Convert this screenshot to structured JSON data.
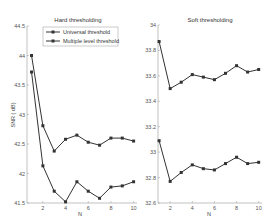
{
  "chart_data": [
    {
      "type": "line",
      "title": "Hard thresholding",
      "xlabel": "N",
      "ylabel": "SNR ( dB)",
      "x": [
        1,
        2,
        3,
        4,
        5,
        6,
        7,
        8,
        9,
        10
      ],
      "xticks": [
        2,
        4,
        6,
        8,
        10
      ],
      "xlim": [
        0.6,
        10.3
      ],
      "ylim": [
        41.5,
        44.5
      ],
      "yticks": [
        41.5,
        42,
        42.5,
        43,
        43.5,
        44,
        44.5
      ],
      "ytick_labels": [
        "41.5",
        "42",
        "42.5",
        "43",
        "43.5",
        "44",
        "44.5"
      ],
      "legend_position": "upper right",
      "grid": false,
      "series": [
        {
          "name": "Universal threshold",
          "values": [
            44.0,
            42.81,
            42.38,
            42.58,
            42.65,
            42.53,
            42.48,
            42.6,
            42.6,
            42.55
          ]
        },
        {
          "name": "Multiple level threshold",
          "values": [
            43.72,
            42.13,
            41.7,
            41.52,
            41.86,
            41.7,
            41.58,
            41.77,
            41.79,
            41.86
          ]
        }
      ]
    },
    {
      "type": "line",
      "title": "Soft thresholding",
      "xlabel": "N",
      "ylabel": "",
      "x": [
        1,
        2,
        3,
        4,
        5,
        6,
        7,
        8,
        9,
        10
      ],
      "xticks": [
        2,
        4,
        6,
        8,
        10
      ],
      "xlim": [
        0.9,
        10.3
      ],
      "ylim": [
        32.6,
        34.0
      ],
      "yticks": [
        32.6,
        32.8,
        33.0,
        33.2,
        33.4,
        33.6,
        33.8,
        34.0
      ],
      "ytick_labels": [
        "32.6",
        "32.8",
        "33",
        "33.2",
        "33.4",
        "33.6",
        "33.8",
        "34"
      ],
      "grid": false,
      "series": [
        {
          "name": "Universal threshold",
          "values": [
            33.87,
            33.5,
            33.55,
            33.61,
            33.59,
            33.57,
            33.62,
            33.68,
            33.63,
            33.65
          ]
        },
        {
          "name": "Multiple level threshold",
          "values": [
            33.09,
            32.77,
            32.84,
            32.9,
            32.87,
            32.86,
            32.91,
            32.96,
            32.91,
            32.92
          ]
        }
      ]
    }
  ],
  "panels": {
    "left": {
      "title": "Hard thresholding",
      "xlabel": "N",
      "ylabel": "SNR ( dB)"
    },
    "right": {
      "title": "Soft thresholding",
      "xlabel": "N"
    }
  },
  "legend": {
    "items": [
      "Universal threshold",
      "Multiple level threshold"
    ]
  },
  "colors": {
    "line": "#333333",
    "axis": "#999999",
    "text": "#555555"
  }
}
